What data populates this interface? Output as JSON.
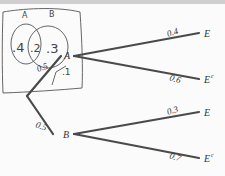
{
  "venn": {
    "label_a": "A",
    "label_b": "B",
    "only_a": ".4",
    "both": ".2",
    "only_b": ".3",
    "neither": ".1"
  },
  "tree": {
    "root_to_a": "0.5",
    "root_to_b": "0.5",
    "node_a": "A",
    "node_b": "B",
    "a_to_e": "0.4",
    "a_to_ec": "0.6",
    "b_to_e": "0.3",
    "b_to_ec": "0.7",
    "outcome_e": "E",
    "outcome_ec_base": "E",
    "outcome_ec_sup": "c"
  },
  "colors": {
    "branch": "#4a4a4a",
    "ink": "#555555",
    "text": "#333333",
    "strip": "#cfcfcf"
  }
}
